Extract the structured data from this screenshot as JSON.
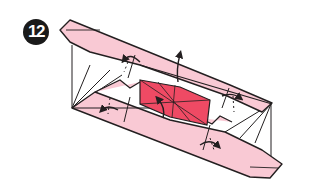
{
  "diagram": {
    "step_number": "12",
    "colors": {
      "background": "#ffffff",
      "paper_light": "#f9c9d4",
      "paper_center": "#ef4a64",
      "line": "#231f20",
      "badge": "#1a1a1a"
    },
    "elements": [
      "upper-strip",
      "lower-strip",
      "center-square",
      "fold-arrows",
      "valley-fold-lines"
    ]
  }
}
